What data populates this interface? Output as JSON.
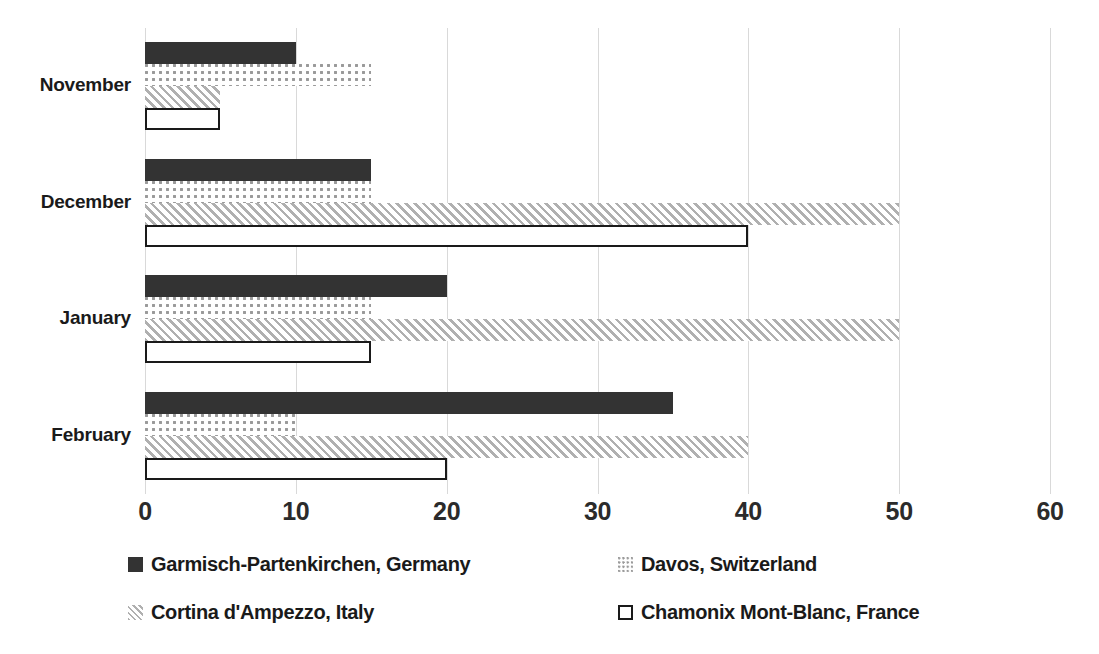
{
  "chart_data": {
    "type": "bar",
    "orientation": "horizontal",
    "title": "",
    "subtitle": "",
    "xlabel": "",
    "ylabel": "",
    "categories": [
      "November",
      "December",
      "January",
      "February"
    ],
    "series": [
      {
        "name": "Garmisch-Partenkirchen, Germany",
        "pattern": "solid-dark",
        "color": "#333333",
        "values": [
          10,
          15,
          20,
          35
        ]
      },
      {
        "name": "Davos, Switzerland",
        "pattern": "dotted",
        "color": "#9a9a9a",
        "values": [
          15,
          15,
          15,
          10
        ]
      },
      {
        "name": "Cortina d'Ampezzo, Italy",
        "pattern": "diagonal-hatch",
        "color": "#b0b0b0",
        "values": [
          5,
          50,
          50,
          40
        ]
      },
      {
        "name": "Chamonix Mont-Blanc, France",
        "pattern": "outline-white",
        "color": "#ffffff",
        "values": [
          5,
          40,
          15,
          20
        ]
      }
    ],
    "xlim": [
      0,
      60
    ],
    "x_ticks": [
      0,
      10,
      20,
      30,
      40,
      50,
      60
    ],
    "x_tick_labels": [
      "0",
      "10",
      "20",
      "30",
      "40",
      "50",
      "60"
    ],
    "grid": true,
    "grid_axis": "x",
    "grid_color": "#d9d9d9",
    "legend_position": "bottom",
    "legend_columns": 2,
    "background": "#ffffff"
  }
}
